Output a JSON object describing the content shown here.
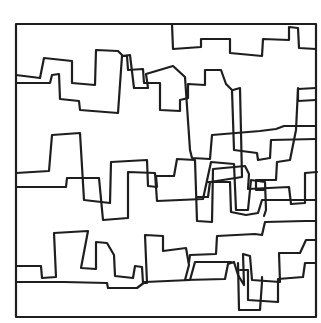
{
  "artwork": {
    "title": "",
    "background": "#ffffff",
    "ink_color": "#1e1e1e",
    "frame": {
      "x": 16,
      "y": 24,
      "width": 300,
      "height": 293
    },
    "paths": [
      {
        "name": "top-skyline-line",
        "points": [
          [
            172,
            24
          ],
          [
            173,
            49
          ],
          [
            201,
            47
          ],
          [
            201,
            39
          ],
          [
            230,
            39
          ],
          [
            230,
            53
          ],
          [
            262,
            56
          ],
          [
            263,
            39
          ],
          [
            289,
            40
          ],
          [
            289,
            27
          ],
          [
            298,
            28
          ],
          [
            299,
            48
          ],
          [
            316,
            49
          ]
        ]
      },
      {
        "name": "upper-line-1",
        "points": [
          [
            16,
            75
          ],
          [
            40,
            78
          ],
          [
            44,
            58
          ],
          [
            72,
            61
          ],
          [
            72,
            83
          ],
          [
            95,
            85
          ],
          [
            96,
            50
          ],
          [
            118,
            51
          ],
          [
            123,
            56
          ],
          [
            127,
            56
          ],
          [
            128,
            70
          ],
          [
            143,
            69
          ],
          [
            144,
            83
          ],
          [
            160,
            83
          ],
          [
            160,
            110
          ],
          [
            180,
            111
          ],
          [
            180,
            100
          ],
          [
            188,
            98
          ],
          [
            188,
            84
          ],
          [
            205,
            85
          ],
          [
            205,
            70
          ],
          [
            221,
            70
          ],
          [
            226,
            84
          ],
          [
            232,
            90
          ],
          [
            234,
            150
          ],
          [
            257,
            153
          ],
          [
            258,
            160
          ],
          [
            270,
            158
          ],
          [
            271,
            140
          ],
          [
            316,
            139
          ]
        ]
      },
      {
        "name": "upper-line-2",
        "points": [
          [
            16,
            83
          ],
          [
            50,
            83
          ],
          [
            52,
            75
          ],
          [
            59,
            74
          ],
          [
            60,
            99
          ],
          [
            79,
            101
          ],
          [
            80,
            110
          ],
          [
            118,
            113
          ],
          [
            122,
            56
          ],
          [
            130,
            55
          ],
          [
            134,
            88
          ],
          [
            148,
            88
          ],
          [
            146,
            74
          ],
          [
            173,
            66
          ],
          [
            185,
            77
          ],
          [
            190,
            150
          ],
          [
            192,
            158
          ],
          [
            210,
            159
          ],
          [
            212,
            135
          ],
          [
            260,
            131
          ],
          [
            276,
            129
          ],
          [
            284,
            126
          ],
          [
            316,
            126
          ]
        ]
      },
      {
        "name": "right-drop-line",
        "points": [
          [
            233,
            90
          ],
          [
            240,
            88
          ],
          [
            242,
            177
          ],
          [
            210,
            182
          ],
          [
            208,
            197
          ],
          [
            197,
            197
          ]
        ]
      },
      {
        "name": "right-step-line",
        "points": [
          [
            298,
            88
          ],
          [
            298,
            101
          ],
          [
            316,
            100
          ]
        ]
      },
      {
        "name": "right-upper-box",
        "points": [
          [
            316,
            88
          ],
          [
            298,
            89
          ],
          [
            296,
            130
          ],
          [
            290,
            160
          ],
          [
            277,
            162
          ],
          [
            276,
            180
          ],
          [
            256,
            180
          ],
          [
            256,
            190
          ],
          [
            264,
            190
          ]
        ]
      },
      {
        "name": "middle-line-1",
        "points": [
          [
            16,
            173
          ],
          [
            49,
            171
          ],
          [
            52,
            135
          ],
          [
            80,
            133
          ],
          [
            84,
            200
          ],
          [
            110,
            203
          ],
          [
            111,
            162
          ],
          [
            147,
            160
          ],
          [
            148,
            186
          ],
          [
            157,
            187
          ],
          [
            156,
            176
          ],
          [
            174,
            176
          ],
          [
            177,
            159
          ],
          [
            195,
            160
          ],
          [
            197,
            221
          ],
          [
            212,
            222
          ],
          [
            213,
            169
          ],
          [
            245,
            166
          ],
          [
            249,
            174
          ],
          [
            248,
            189
          ],
          [
            289,
            187
          ],
          [
            291,
            204
          ],
          [
            305,
            203
          ],
          [
            305,
            173
          ],
          [
            317,
            172
          ]
        ]
      },
      {
        "name": "middle-line-2",
        "points": [
          [
            16,
            187
          ],
          [
            66,
            187
          ],
          [
            67,
            178
          ],
          [
            99,
            178
          ],
          [
            103,
            220
          ],
          [
            128,
            218
          ],
          [
            128,
            172
          ],
          [
            155,
            173
          ],
          [
            157,
            201
          ],
          [
            203,
            199
          ],
          [
            211,
            162
          ],
          [
            234,
            164
          ],
          [
            236,
            210
          ],
          [
            248,
            210
          ],
          [
            251,
            180
          ],
          [
            265,
            182
          ],
          [
            266,
            210
          ],
          [
            264,
            216
          ]
        ]
      },
      {
        "name": "middle-right-line",
        "points": [
          [
            208,
            182
          ],
          [
            230,
            182
          ],
          [
            231,
            212
          ],
          [
            246,
            215
          ],
          [
            258,
            213
          ],
          [
            262,
            200
          ],
          [
            290,
            200
          ],
          [
            316,
            200
          ]
        ]
      },
      {
        "name": "lower-line-1",
        "points": [
          [
            16,
            266
          ],
          [
            41,
            266
          ],
          [
            42,
            278
          ],
          [
            56,
            277
          ],
          [
            54,
            233
          ],
          [
            88,
            231
          ],
          [
            81,
            268
          ],
          [
            96,
            269
          ],
          [
            96,
            242
          ],
          [
            107,
            243
          ],
          [
            114,
            255
          ],
          [
            115,
            276
          ],
          [
            133,
            278
          ],
          [
            135,
            266
          ],
          [
            142,
            267
          ],
          [
            143,
            283
          ],
          [
            147,
            283
          ],
          [
            145,
            235
          ],
          [
            163,
            236
          ],
          [
            163,
            251
          ],
          [
            186,
            248
          ],
          [
            189,
            265
          ],
          [
            185,
            280
          ],
          [
            225,
            279
          ],
          [
            228,
            264
          ],
          [
            234,
            262
          ],
          [
            238,
            275
          ],
          [
            244,
            285
          ],
          [
            243,
            254
          ],
          [
            250,
            256
          ],
          [
            252,
            280
          ],
          [
            280,
            282
          ],
          [
            279,
            253
          ],
          [
            300,
            253
          ],
          [
            306,
            240
          ],
          [
            316,
            240
          ]
        ]
      },
      {
        "name": "lower-line-2",
        "points": [
          [
            16,
            282
          ],
          [
            64,
            282
          ],
          [
            107,
            283
          ],
          [
            108,
            288
          ],
          [
            137,
            288
          ],
          [
            145,
            282
          ],
          [
            190,
            280
          ],
          [
            195,
            262
          ],
          [
            231,
            262
          ]
        ]
      },
      {
        "name": "lower-right-line",
        "points": [
          [
            189,
            262
          ],
          [
            190,
            255
          ],
          [
            216,
            254
          ],
          [
            217,
            236
          ],
          [
            255,
            234
          ],
          [
            262,
            235
          ],
          [
            265,
            222
          ],
          [
            305,
            221
          ],
          [
            315,
            221
          ]
        ]
      },
      {
        "name": "bottom-right-box",
        "points": [
          [
            240,
            270
          ],
          [
            248,
            270
          ],
          [
            248,
            300
          ],
          [
            278,
            302
          ],
          [
            278,
            279
          ],
          [
            303,
            277
          ],
          [
            305,
            263
          ],
          [
            316,
            263
          ]
        ]
      },
      {
        "name": "bottom-left-box",
        "points": [
          [
            238,
            263
          ],
          [
            239,
            310
          ],
          [
            260,
            310
          ],
          [
            262,
            282
          ],
          [
            262,
            277
          ]
        ]
      }
    ]
  }
}
